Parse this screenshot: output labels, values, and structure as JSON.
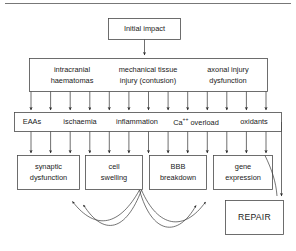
{
  "diagram": {
    "type": "flowchart",
    "title_rule_visible": true,
    "nodes": {
      "initial_impact": {
        "label": "Initial impact"
      },
      "primary_injury": {
        "items": [
          {
            "line1": "intracranial",
            "line2": "haematomas"
          },
          {
            "line1": "mechanical tissue",
            "line2": "injury (contusion)"
          },
          {
            "line1": "axonal injury",
            "line2": "dysfunction"
          }
        ]
      },
      "mediators": {
        "items": [
          {
            "label": "EAAs"
          },
          {
            "label": "ischaemia"
          },
          {
            "label": "inflammation"
          },
          {
            "label": "Ca",
            "superscript": "++",
            "suffix": " overload"
          },
          {
            "label": "oxidants"
          }
        ]
      },
      "outcomes": {
        "items": [
          {
            "line1": "synaptic",
            "line2": "dysfunction"
          },
          {
            "line1": "cell",
            "line2": "swelling"
          },
          {
            "line1": "BBB",
            "line2": "breakdown"
          },
          {
            "line1": "gene",
            "line2": "expression"
          }
        ]
      },
      "repair": {
        "label": "REPAIR"
      }
    },
    "edges": {
      "impact_to_primary": {
        "kind": "arrow-down",
        "count": 1
      },
      "primary_to_mediators": {
        "kind": "arrow-down-fan",
        "count": 13
      },
      "mediators_to_outcomes": {
        "kind": "arrow-down-fan",
        "count": 13
      },
      "outcomes_feedback_left": {
        "kind": "curved-arrow",
        "count": 2
      },
      "outcomes_feedback_right": {
        "kind": "curved-arrow",
        "count": 2
      },
      "gene_to_repair": {
        "kind": "curved-connector",
        "count": 1
      },
      "right_rail_to_repair": {
        "kind": "arrow-down",
        "count": 1
      }
    },
    "colors": {
      "stroke": "#4a4a4a",
      "text": "#1a1a1a",
      "background": "#ffffff",
      "rule": "#777777"
    }
  }
}
